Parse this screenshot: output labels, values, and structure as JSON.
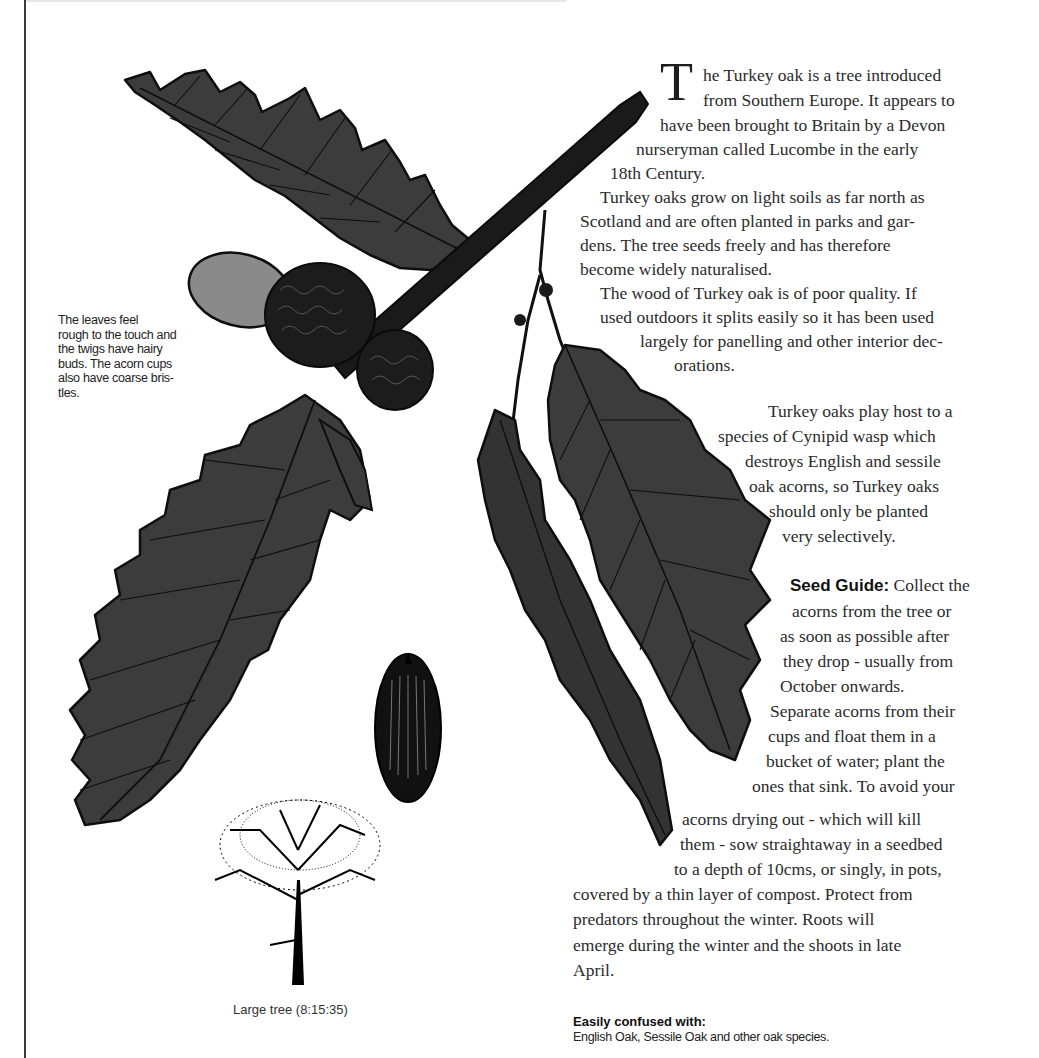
{
  "page": {
    "drop_cap": "T",
    "intro_lines": [
      "he Turkey oak is a tree introduced",
      "from Southern Europe. It appears to",
      "have been brought to Britain by a Devon",
      "nurseryman called Lucombe in the early",
      "18th Century."
    ],
    "para2_lines": [
      "Turkey oaks grow on light soils as far north as",
      "Scotland and are often planted in parks and gar-",
      "dens. The tree seeds freely and has therefore",
      "become widely naturalised."
    ],
    "para3_lines": [
      "The wood of Turkey oak is of poor quality. If",
      "used outdoors it splits easily so it has been used",
      "largely for panelling and other interior dec-",
      "orations."
    ],
    "para4_lines": [
      "Turkey oaks play host to a",
      "species of Cynipid wasp which",
      "destroys English and sessile",
      "oak acorns, so Turkey oaks",
      "should only be planted",
      "very selectively."
    ],
    "seed_guide": {
      "label": "Seed Guide:",
      "first_line_rest": " Collect the",
      "lines": [
        "acorns  from the tree or",
        "as soon as possible after",
        "they drop  - usually from",
        "October onwards.",
        "Separate acorns from their",
        "cups and float them in a",
        "bucket of water; plant the",
        "ones that sink. To avoid your",
        "acorns drying out - which will kill",
        "them - sow straightaway in a seedbed",
        "to a depth of 10cms, or singly, in pots,",
        "covered by a thin layer of compost. Protect from",
        "predators throughout the winter. Roots will",
        "emerge during the winter and the shoots in late",
        "April."
      ]
    },
    "side_note": "The leaves feel rough to the touch and the twigs have hairy buds. The acorn cups also have coarse bris-tles.",
    "side_note_lines": [
      "The leaves feel",
      "rough to the touch and",
      "the twigs have hairy",
      "buds. The acorn cups",
      "also have coarse bris-",
      "tles."
    ],
    "tree_caption": "Large tree (8:15:35)",
    "confused": {
      "heading": "Easily confused with:",
      "text": "English Oak, Sessile Oak and other oak species."
    }
  },
  "illustrations": {
    "leaf_color": "#3c3c3c",
    "outline_color": "#0e0e0e",
    "acorn_cap_color": "#8a8a8a"
  }
}
